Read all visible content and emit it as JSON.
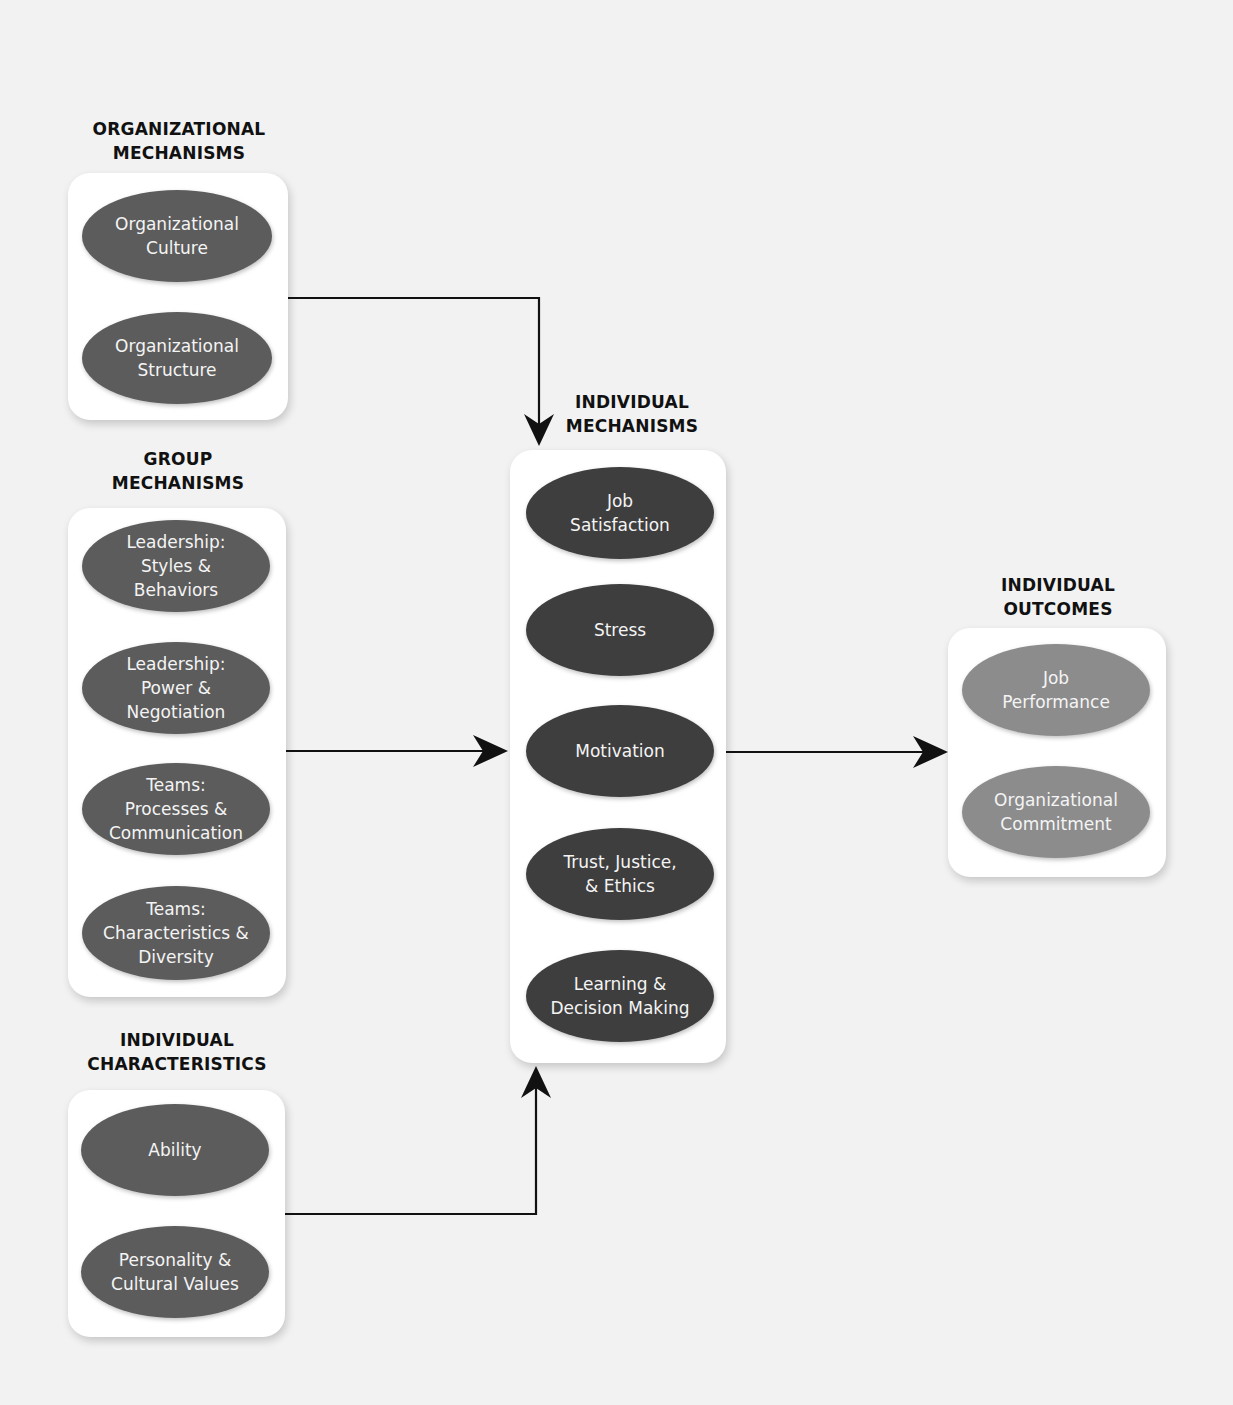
{
  "colors": {
    "background": "#f2f2f2",
    "box": "#ffffff",
    "ellipse_left": "#5c5c5c",
    "ellipse_center": "#3e3e3e",
    "ellipse_outcome": "#8c8c8c",
    "arrow": "#111111"
  },
  "groups": {
    "organizational": {
      "title": "ORGANIZATIONAL\nMECHANISMS",
      "items": [
        "Organizational\nCulture",
        "Organizational\nStructure"
      ]
    },
    "group": {
      "title": "GROUP\nMECHANISMS",
      "items": [
        "Leadership:\nStyles &\nBehaviors",
        "Leadership:\nPower &\nNegotiation",
        "Teams:\nProcesses &\nCommunication",
        "Teams:\nCharacteristics &\nDiversity"
      ]
    },
    "individual_characteristics": {
      "title": "INDIVIDUAL\nCHARACTERISTICS",
      "items": [
        "Ability",
        "Personality &\nCultural Values"
      ]
    },
    "individual_mechanisms": {
      "title": "INDIVIDUAL\nMECHANISMS",
      "items": [
        "Job\nSatisfaction",
        "Stress",
        "Motivation",
        "Trust, Justice,\n& Ethics",
        "Learning &\nDecision Making"
      ]
    },
    "individual_outcomes": {
      "title": "INDIVIDUAL\nOUTCOMES",
      "items": [
        "Job\nPerformance",
        "Organizational\nCommitment"
      ]
    }
  },
  "connections": [
    {
      "from": "organizational",
      "to": "individual_mechanisms"
    },
    {
      "from": "group",
      "to": "individual_mechanisms"
    },
    {
      "from": "individual_characteristics",
      "to": "individual_mechanisms"
    },
    {
      "from": "individual_mechanisms",
      "to": "individual_outcomes"
    }
  ]
}
